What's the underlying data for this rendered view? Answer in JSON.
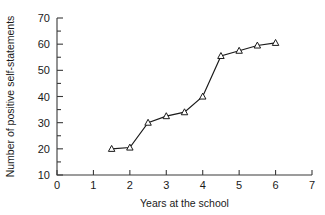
{
  "chart_data": {
    "type": "line",
    "title": "",
    "xlabel": "Years at the school",
    "ylabel": "Number of positive self-statements",
    "xlim": [
      0,
      7
    ],
    "ylim": [
      10,
      70
    ],
    "grid": false,
    "legend": null,
    "marker": "open-triangle",
    "x": [
      1.5,
      2.0,
      2.5,
      3.0,
      3.5,
      4.0,
      4.5,
      5.0,
      5.5,
      6.0
    ],
    "values": [
      20,
      20.5,
      30,
      32.5,
      34,
      40,
      55.5,
      57.5,
      59.5,
      60.5
    ],
    "xticks": [
      0,
      1,
      2,
      3,
      4,
      5,
      6,
      7
    ],
    "xtick_labels": [
      "0",
      "1",
      "2",
      "3",
      "4",
      "5",
      "6",
      "7"
    ],
    "yticks": [
      10,
      20,
      30,
      40,
      50,
      60,
      70
    ],
    "ytick_labels": [
      "10",
      "20",
      "30",
      "40",
      "50",
      "60",
      "70"
    ],
    "yticks_minor": [
      15,
      25,
      35,
      45,
      55,
      65
    ]
  },
  "axes": {
    "x_title": "Years at the school",
    "y_title": "Number of positive self-statements"
  }
}
